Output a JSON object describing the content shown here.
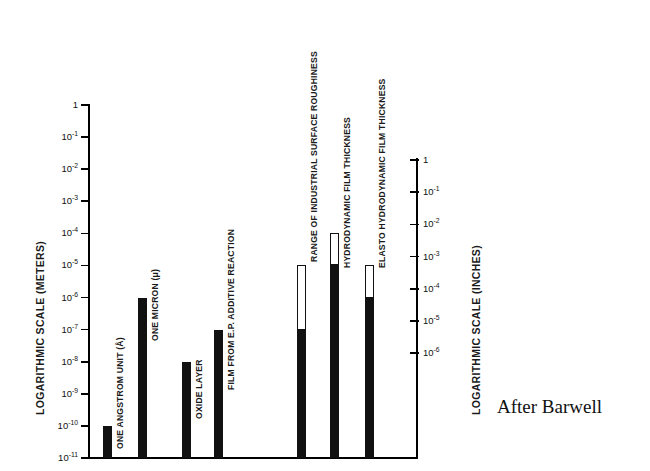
{
  "chart_data": {
    "type": "bar",
    "title": "",
    "attribution": "After Barwell",
    "ylabel_left": "LOGARITHMIC SCALE (METERS)",
    "ylabel_right": "LOGARITHMIC SCALE (INCHES)",
    "xlabel": "",
    "grid": false,
    "legend": "none",
    "scale": "log",
    "axis_left": {
      "label": "LOGARITHMIC SCALE (METERS)",
      "ticks": [
        {
          "text": "1",
          "exp": 0,
          "value": 1
        },
        {
          "text": "10",
          "exp": -1,
          "value": 0.1
        },
        {
          "text": "10",
          "exp": -2,
          "value": 0.01
        },
        {
          "text": "10",
          "exp": -3,
          "value": 0.001
        },
        {
          "text": "10",
          "exp": -4,
          "value": 0.0001
        },
        {
          "text": "10",
          "exp": -5,
          "value": 1e-05
        },
        {
          "text": "10",
          "exp": -6,
          "value": 1e-06
        },
        {
          "text": "10",
          "exp": -7,
          "value": 1e-07
        },
        {
          "text": "10",
          "exp": -8,
          "value": 1e-08
        },
        {
          "text": "10",
          "exp": -9,
          "value": 1e-09
        },
        {
          "text": "10",
          "exp": -10,
          "value": 1e-10
        },
        {
          "text": "10",
          "exp": -11,
          "value": 1e-11
        }
      ],
      "top_exp": 0,
      "bottom_exp": -11
    },
    "axis_right": {
      "label": "LOGARITHMIC SCALE (INCHES)",
      "ticks": [
        {
          "text": "1",
          "exp": 0,
          "value": 1
        },
        {
          "text": "10",
          "exp": -1,
          "value": 0.1
        },
        {
          "text": "10",
          "exp": -2,
          "value": 0.01
        },
        {
          "text": "10",
          "exp": -3,
          "value": 0.001
        },
        {
          "text": "10",
          "exp": -4,
          "value": 0.0001
        },
        {
          "text": "10",
          "exp": -5,
          "value": 1e-05
        },
        {
          "text": "10",
          "exp": -6,
          "value": 1e-06
        }
      ],
      "top_exp": 0,
      "bottom_exp": -6
    },
    "bars": [
      {
        "label": "ONE ANGSTROM UNIT (Å)",
        "style": "solid",
        "top_exp": -10,
        "bottom_exp": -11,
        "group": "left"
      },
      {
        "label": "ONE MICRON (μ)",
        "style": "solid",
        "top_exp": -6,
        "bottom_exp": -11,
        "group": "left"
      },
      {
        "label": "OXIDE LAYER",
        "style": "solid",
        "top_exp": -8,
        "bottom_exp": -11,
        "group": "left"
      },
      {
        "label": "FILM FROM E.P. ADDITIVE REACTION",
        "style": "solid",
        "top_exp": -7,
        "bottom_exp": -11,
        "group": "left"
      },
      {
        "label": "RANGE OF INDUSTRIAL SURFACE ROUGHINESS",
        "style": "range",
        "top_exp": -5,
        "fill_top_exp": -7,
        "bottom_exp": -11,
        "group": "right"
      },
      {
        "label": "HYDRODYNAMIC FILM THICKNESS",
        "style": "range",
        "top_exp": -4,
        "fill_top_exp": -5,
        "bottom_exp": -11,
        "group": "right"
      },
      {
        "label": "ELASTO HYDRODYNAMIC FILM THICKNESS",
        "style": "range",
        "top_exp": -5,
        "fill_top_exp": -6,
        "bottom_exp": -11,
        "group": "right"
      }
    ]
  }
}
